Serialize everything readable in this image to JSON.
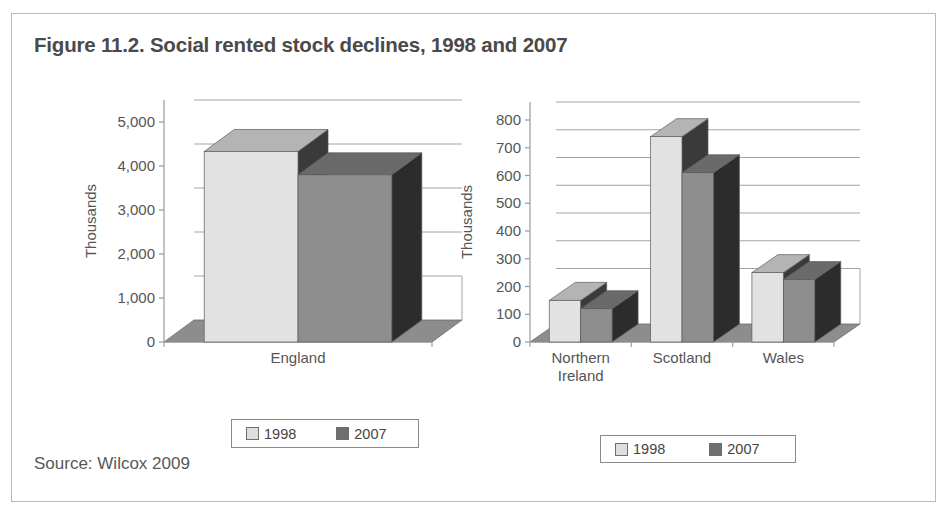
{
  "figure": {
    "title": "Figure 11.2. Social rented stock declines, 1998 and 2007",
    "source": "Source: Wilcox 2009"
  },
  "legend": {
    "series_1998": "1998",
    "series_2007": "2007",
    "swatch_1998_color": "#dedede",
    "swatch_2007_color": "#6e6e6e"
  },
  "chart_data": [
    {
      "id": "england",
      "type": "bar",
      "title": "",
      "xlabel": "",
      "ylabel": "Thousands",
      "categories": [
        "England"
      ],
      "series": [
        {
          "name": "1998",
          "values": [
            4330
          ]
        },
        {
          "name": "2007",
          "values": [
            3800
          ]
        }
      ],
      "ylim": [
        0,
        5000
      ],
      "yticks": [
        0,
        1000,
        2000,
        3000,
        4000,
        5000
      ],
      "ytick_labels": [
        "0",
        "1,000",
        "2,000",
        "3,000",
        "4,000",
        "5,000"
      ],
      "grid": true,
      "three_d": true,
      "legend_position": "below"
    },
    {
      "id": "nations",
      "type": "bar",
      "title": "",
      "xlabel": "",
      "ylabel": "Thousands",
      "categories": [
        "Northern Ireland",
        "Scotland",
        "Wales"
      ],
      "category_lines": [
        [
          "Northern",
          "Ireland"
        ],
        [
          "Scotland"
        ],
        [
          "Wales"
        ]
      ],
      "series": [
        {
          "name": "1998",
          "values": [
            150,
            740,
            250
          ]
        },
        {
          "name": "2007",
          "values": [
            120,
            610,
            225
          ]
        }
      ],
      "ylim": [
        0,
        800
      ],
      "yticks": [
        0,
        100,
        200,
        300,
        400,
        500,
        600,
        700,
        800
      ],
      "ytick_labels": [
        "0",
        "100",
        "200",
        "300",
        "400",
        "500",
        "600",
        "700",
        "800"
      ],
      "grid": true,
      "three_d": true,
      "legend_position": "below"
    }
  ]
}
